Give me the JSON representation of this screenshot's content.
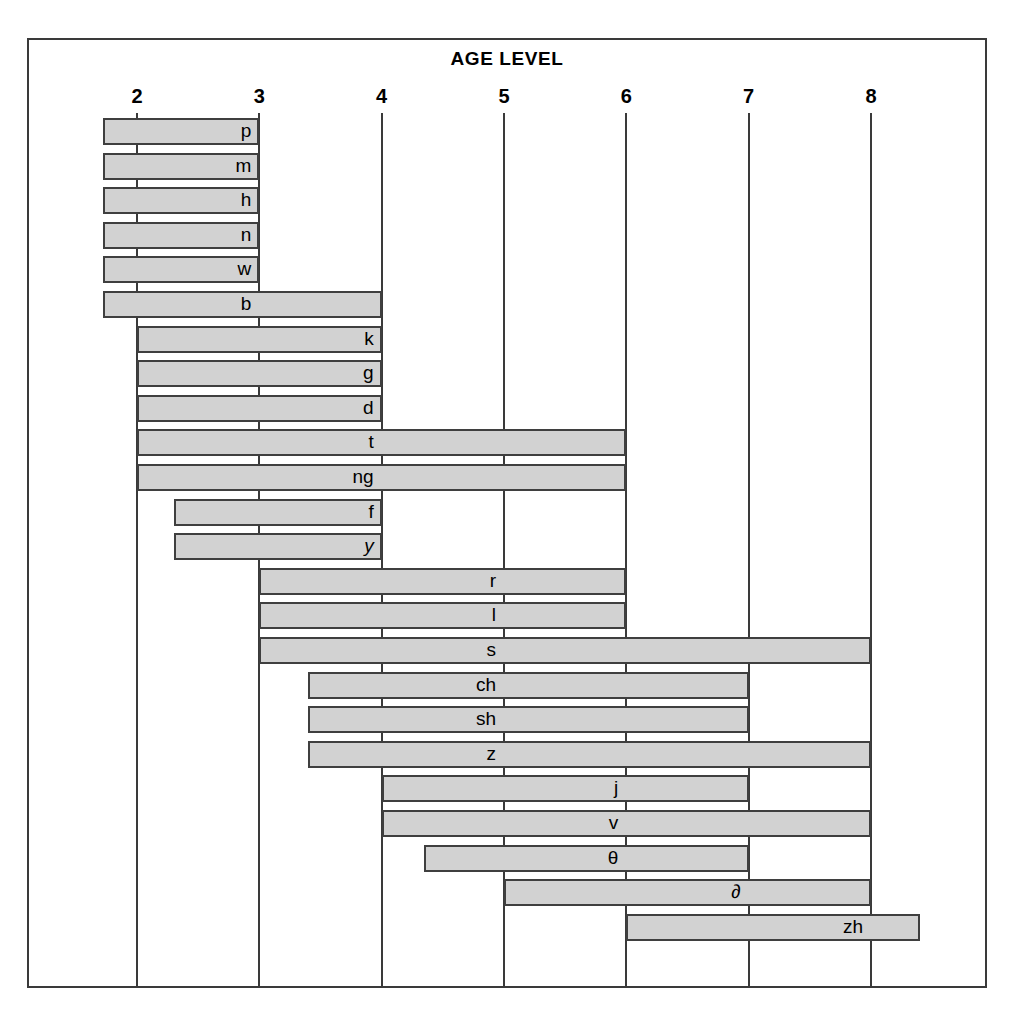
{
  "title": "AGE LEVEL",
  "axis": {
    "label": "AGE LEVEL",
    "ticks": [
      "2",
      "3",
      "4",
      "5",
      "6",
      "7",
      "8"
    ],
    "tick_values": [
      2,
      3,
      4,
      5,
      6,
      7,
      8
    ],
    "min": 1.6,
    "max": 8.95
  },
  "colors": {
    "bar_fill": "#d2d2d2",
    "bar_stroke": "#3f3f3f",
    "frame": "#3a3a3a",
    "text": "#000000",
    "background": "#ffffff"
  },
  "chart_data": {
    "type": "bar",
    "title": "AGE LEVEL",
    "xlabel": "AGE LEVEL",
    "ylabel": "",
    "orientation": "horizontal",
    "subtype": "range-bar",
    "xlim": [
      1.6,
      8.95
    ],
    "grid": true,
    "legend": false,
    "xticks": [
      2,
      3,
      4,
      5,
      6,
      7,
      8
    ],
    "xticklabels": [
      "2",
      "3",
      "4",
      "5",
      "6",
      "7",
      "8"
    ],
    "categories": [
      "p",
      "m",
      "h",
      "n",
      "w",
      "b",
      "k",
      "g",
      "d",
      "t",
      "ng",
      "f",
      "y",
      "r",
      "l",
      "s",
      "ch",
      "sh",
      "z",
      "j",
      "v",
      "θ",
      "∂",
      "zh"
    ],
    "bars": [
      {
        "label": "p",
        "start": 1.72,
        "end": 3.0,
        "label_at": 3.0,
        "italic": false
      },
      {
        "label": "m",
        "start": 1.72,
        "end": 3.0,
        "label_at": 3.0,
        "italic": false
      },
      {
        "label": "h",
        "start": 1.72,
        "end": 3.0,
        "label_at": 3.0,
        "italic": false
      },
      {
        "label": "n",
        "start": 1.72,
        "end": 3.0,
        "label_at": 3.0,
        "italic": false
      },
      {
        "label": "w",
        "start": 1.72,
        "end": 3.0,
        "label_at": 3.0,
        "italic": false
      },
      {
        "label": "b",
        "start": 1.72,
        "end": 4.0,
        "label_at": 3.0,
        "italic": false
      },
      {
        "label": "k",
        "start": 2.0,
        "end": 4.0,
        "label_at": 4.0,
        "italic": false
      },
      {
        "label": "g",
        "start": 2.0,
        "end": 4.0,
        "label_at": 4.0,
        "italic": false
      },
      {
        "label": "d",
        "start": 2.0,
        "end": 4.0,
        "label_at": 4.0,
        "italic": false
      },
      {
        "label": "t",
        "start": 2.0,
        "end": 6.0,
        "label_at": 4.0,
        "italic": false
      },
      {
        "label": "ng",
        "start": 2.0,
        "end": 6.0,
        "label_at": 4.0,
        "italic": false
      },
      {
        "label": "f",
        "start": 2.3,
        "end": 4.0,
        "label_at": 4.0,
        "italic": false
      },
      {
        "label": "y",
        "start": 2.3,
        "end": 4.0,
        "label_at": 4.0,
        "italic": true
      },
      {
        "label": "r",
        "start": 3.0,
        "end": 6.0,
        "label_at": 5.0,
        "italic": false
      },
      {
        "label": "l",
        "start": 3.0,
        "end": 6.0,
        "label_at": 5.0,
        "italic": false
      },
      {
        "label": "s",
        "start": 3.0,
        "end": 8.0,
        "label_at": 5.0,
        "italic": false
      },
      {
        "label": "ch",
        "start": 3.4,
        "end": 7.0,
        "label_at": 5.0,
        "italic": false
      },
      {
        "label": "sh",
        "start": 3.4,
        "end": 7.0,
        "label_at": 5.0,
        "italic": false
      },
      {
        "label": "z",
        "start": 3.4,
        "end": 8.0,
        "label_at": 5.0,
        "italic": false
      },
      {
        "label": "j",
        "start": 4.0,
        "end": 7.0,
        "label_at": 6.0,
        "italic": false
      },
      {
        "label": "v",
        "start": 4.0,
        "end": 8.0,
        "label_at": 6.0,
        "italic": false
      },
      {
        "label": "θ",
        "start": 4.35,
        "end": 7.0,
        "label_at": 6.0,
        "italic": false
      },
      {
        "label": "∂",
        "start": 5.0,
        "end": 8.0,
        "label_at": 7.0,
        "italic": false
      },
      {
        "label": "zh",
        "start": 6.0,
        "end": 8.4,
        "label_at": 8.0,
        "italic": false
      }
    ]
  }
}
